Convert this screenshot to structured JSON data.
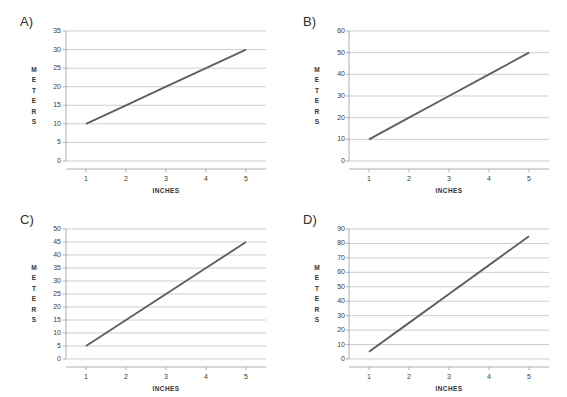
{
  "figure": {
    "background_color": "#ffffff",
    "panel_count": 4
  },
  "panels": [
    {
      "letter": "A)",
      "axis_title_y": "METERS",
      "axis_title_x": "INCHES",
      "y_ticks": [
        "0",
        "5",
        "10",
        "15",
        "20",
        "25",
        "30",
        "35"
      ],
      "x_ticks": [
        "1",
        "2",
        "3",
        "4",
        "5"
      ]
    },
    {
      "letter": "B)",
      "axis_title_y": "METERS",
      "axis_title_x": "INCHES",
      "y_ticks": [
        "0",
        "10",
        "20",
        "30",
        "40",
        "50",
        "60"
      ],
      "x_ticks": [
        "1",
        "2",
        "3",
        "4",
        "5"
      ]
    },
    {
      "letter": "C)",
      "axis_title_y": "METERS",
      "axis_title_x": "INCHES",
      "y_ticks": [
        "0",
        "5",
        "10",
        "15",
        "20",
        "25",
        "30",
        "35",
        "40",
        "45",
        "50"
      ],
      "x_ticks": [
        "1",
        "2",
        "3",
        "4",
        "5"
      ]
    },
    {
      "letter": "D)",
      "axis_title_y": "METERS",
      "axis_title_x": "INCHES",
      "y_ticks": [
        "0",
        "10",
        "20",
        "30",
        "40",
        "50",
        "60",
        "70",
        "80",
        "90"
      ],
      "x_ticks": [
        "1",
        "2",
        "3",
        "4",
        "5"
      ]
    }
  ],
  "chart_data": [
    {
      "type": "line",
      "title": "A)",
      "xlabel": "INCHES",
      "ylabel": "METERS",
      "x": [
        1,
        2,
        3,
        4,
        5
      ],
      "values": [
        10,
        15,
        20,
        25,
        30
      ],
      "series": [
        {
          "name": "meters vs inches",
          "values": [
            10,
            15,
            20,
            25,
            30
          ]
        }
      ],
      "xlim": [
        0.5,
        5.5
      ],
      "ylim": [
        0,
        35
      ],
      "ytick_values": [
        0,
        5,
        10,
        15,
        20,
        25,
        30,
        35
      ],
      "xtick_values": [
        1,
        2,
        3,
        4,
        5
      ],
      "grid": "horizontal",
      "legend": "none",
      "line_color": "#5f5f5f",
      "slope": 5,
      "intercept": 5
    },
    {
      "type": "line",
      "title": "B)",
      "xlabel": "INCHES",
      "ylabel": "METERS",
      "x": [
        1,
        2,
        3,
        4,
        5
      ],
      "values": [
        10,
        20,
        30,
        40,
        50
      ],
      "series": [
        {
          "name": "meters vs inches",
          "values": [
            10,
            20,
            30,
            40,
            50
          ]
        }
      ],
      "xlim": [
        0.5,
        5.5
      ],
      "ylim": [
        0,
        60
      ],
      "ytick_values": [
        0,
        10,
        20,
        30,
        40,
        50,
        60
      ],
      "xtick_values": [
        1,
        2,
        3,
        4,
        5
      ],
      "grid": "horizontal",
      "legend": "none",
      "line_color": "#5f5f5f",
      "slope": 10,
      "intercept": 0
    },
    {
      "type": "line",
      "title": "C)",
      "xlabel": "INCHES",
      "ylabel": "METERS",
      "x": [
        1,
        2,
        3,
        4,
        5
      ],
      "values": [
        5,
        15,
        25,
        35,
        45
      ],
      "series": [
        {
          "name": "meters vs inches",
          "values": [
            5,
            15,
            25,
            35,
            45
          ]
        }
      ],
      "xlim": [
        0.5,
        5.5
      ],
      "ylim": [
        0,
        50
      ],
      "ytick_values": [
        0,
        5,
        10,
        15,
        20,
        25,
        30,
        35,
        40,
        45,
        50
      ],
      "xtick_values": [
        1,
        2,
        3,
        4,
        5
      ],
      "grid": "horizontal",
      "legend": "none",
      "line_color": "#5f5f5f",
      "slope": 10,
      "intercept": -5
    },
    {
      "type": "line",
      "title": "D)",
      "xlabel": "INCHES",
      "ylabel": "METERS",
      "x": [
        1,
        2,
        3,
        4,
        5
      ],
      "values": [
        5,
        25,
        45,
        65,
        85
      ],
      "series": [
        {
          "name": "meters vs inches",
          "values": [
            5,
            25,
            45,
            65,
            85
          ]
        }
      ],
      "xlim": [
        0.5,
        5.5
      ],
      "ylim": [
        0,
        90
      ],
      "ytick_values": [
        0,
        10,
        20,
        30,
        40,
        50,
        60,
        70,
        80,
        90
      ],
      "xtick_values": [
        1,
        2,
        3,
        4,
        5
      ],
      "grid": "horizontal",
      "legend": "none",
      "line_color": "#5f5f5f",
      "slope": 20,
      "intercept": -15
    }
  ]
}
